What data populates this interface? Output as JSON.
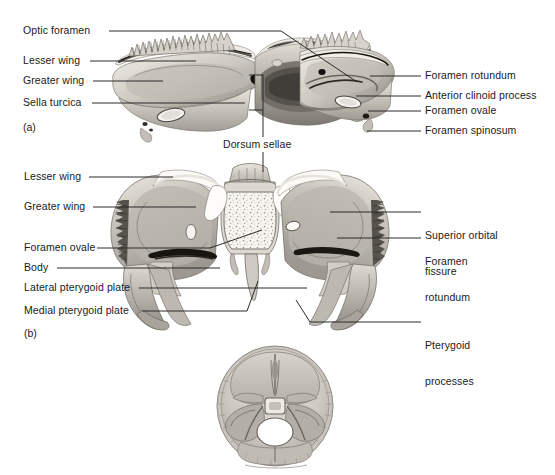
{
  "figure": {
    "background": "#ffffff",
    "text_color": "#1a1a1a",
    "leader_color": "#2b2b2b",
    "bone_tones": {
      "highlight": "#f2efe9",
      "light": "#dedbd3",
      "mid": "#bdb9b0",
      "shade": "#9a968e",
      "dark": "#6f6b64",
      "deep": "#3c3935",
      "cavity": "#2a2724"
    }
  },
  "panels": [
    {
      "id": "a",
      "tag": "(a)",
      "view": "superior view of sphenoid bone",
      "labels_left": [
        {
          "text": "Optic foramen"
        },
        {
          "text": "Lesser wing"
        },
        {
          "text": "Greater wing"
        },
        {
          "text": "Sella turcica"
        }
      ],
      "labels_right": [
        {
          "text": "Foramen rotundum"
        },
        {
          "text": "Anterior clinoid process"
        },
        {
          "text": "Foramen ovale"
        },
        {
          "text": "Foramen spinosum"
        }
      ],
      "labels_center": [
        {
          "text": "Dorsum sellae"
        }
      ]
    },
    {
      "id": "b",
      "tag": "(b)",
      "view": "anterior view of sphenoid bone",
      "labels_left": [
        {
          "text": "Lesser wing"
        },
        {
          "text": "Greater wing"
        },
        {
          "text": "Foramen ovale"
        },
        {
          "text": "Body"
        },
        {
          "text": "Lateral pterygoid plate"
        },
        {
          "text": "Medial pterygoid plate"
        }
      ],
      "labels_right": [
        {
          "text": "Superior orbital",
          "text2": "fissure"
        },
        {
          "text": "Foramen",
          "text2": "rotundum"
        },
        {
          "text": "Pterygoid",
          "text2": "processes"
        }
      ]
    },
    {
      "id": "c",
      "tag": "",
      "view": "inset: superior view of cranial floor showing sphenoid in situ",
      "labels_left": [],
      "labels_right": []
    }
  ]
}
